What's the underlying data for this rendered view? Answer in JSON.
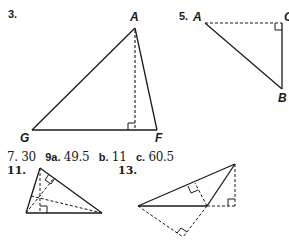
{
  "figures": [
    {
      "number": "3.",
      "vertices": {
        "top": "A",
        "left": "G",
        "right": "F"
      }
    },
    {
      "number": "5.",
      "vertices": {
        "left": "A",
        "right": "C",
        "bottom": "B"
      }
    },
    {
      "number": "11."
    },
    {
      "number": "13."
    }
  ],
  "answers": [
    {
      "label": "7.",
      "value": "30"
    },
    {
      "label": "9a.",
      "value": "49.5"
    },
    {
      "label": "b.",
      "value": "11"
    },
    {
      "label": "c.",
      "value": "60.5"
    }
  ],
  "colors": {
    "stroke": "#1a1a1a"
  }
}
